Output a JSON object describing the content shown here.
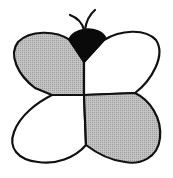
{
  "figure": {
    "colors": {
      "outline": "#111111",
      "shaded_wing": "#b8b8b8",
      "plain_wing": "#ffffff",
      "head": "#0a0a0a",
      "background": "#ffffff"
    },
    "wings": [
      {
        "position": "top-left",
        "fill": "shaded"
      },
      {
        "position": "top-right",
        "fill": "plain"
      },
      {
        "position": "bottom-left",
        "fill": "plain"
      },
      {
        "position": "bottom-right",
        "fill": "shaded"
      }
    ]
  }
}
